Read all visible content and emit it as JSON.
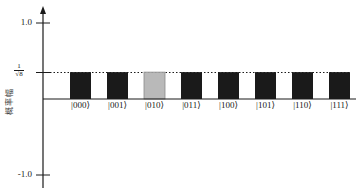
{
  "chart_data": {
    "type": "bar",
    "title": "",
    "xlabel": "",
    "ylabel": "概率幅",
    "ylim": [
      -1.0,
      1.0
    ],
    "y_ticks": [
      {
        "value": 1.0,
        "label": "1.0"
      },
      {
        "value": 0.35355,
        "label_num": "1",
        "label_den": "√8"
      },
      {
        "value": -1.0,
        "label": "-1.0"
      }
    ],
    "categories": [
      "|000⟩",
      "|001⟩",
      "|010⟩",
      "|011⟩",
      "|100⟩",
      "|101⟩",
      "|110⟩",
      "|111⟩"
    ],
    "values": [
      0.35355,
      0.35355,
      0.35355,
      0.35355,
      0.35355,
      0.35355,
      0.35355,
      0.35355
    ],
    "highlighted_index": 2,
    "reference_line": {
      "value": 0.35355,
      "style": "dotted",
      "label": "1/√8"
    },
    "grid": false,
    "legend": null,
    "colors": {
      "bar": "#1a1a1a",
      "highlight_bar": "#b9b9b9",
      "highlight_border": "#8a8a8a",
      "axis": "#1a1a1a"
    }
  }
}
